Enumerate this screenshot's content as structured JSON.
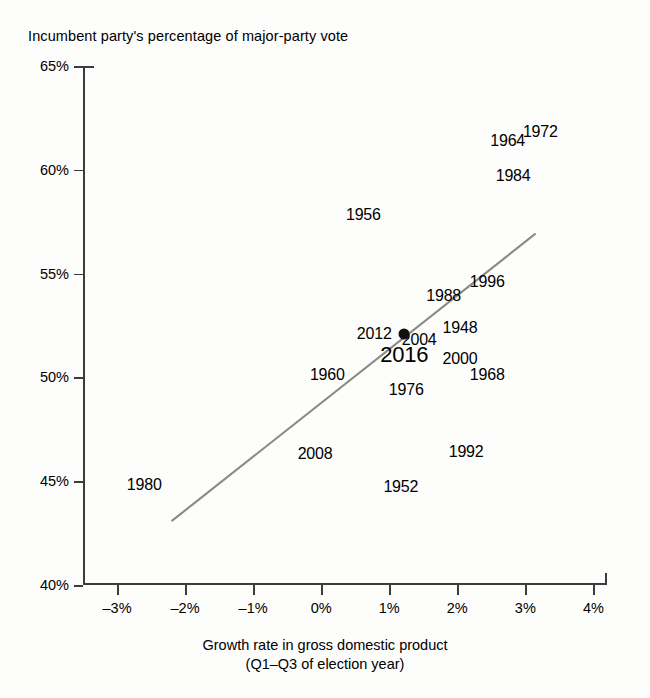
{
  "chart_data": {
    "type": "scatter",
    "title": "",
    "ylabel": "Incumbent party's percentage of major-party vote",
    "xlabel": "Growth rate in gross domestic product",
    "xlabel_line2": "(Q1–Q3 of election year)",
    "xlim": [
      -3.5,
      4.2
    ],
    "ylim": [
      40,
      65
    ],
    "grid": false,
    "legend": null,
    "x_tick_labels": [
      "–3%",
      "–2%",
      "–1%",
      "0%",
      "1%",
      "2%",
      "3%",
      "4%"
    ],
    "x_tick_values": [
      -3,
      -2,
      -1,
      0,
      1,
      2,
      3,
      4
    ],
    "y_tick_labels": [
      "65%",
      "60%",
      "55%",
      "50%",
      "45%",
      "40%"
    ],
    "y_tick_values": [
      65,
      60,
      55,
      50,
      45,
      40
    ],
    "point_label_field": "year",
    "points": [
      {
        "year": "1948",
        "x": 2.04,
        "y": 52.4,
        "marker": "label",
        "highlight": false
      },
      {
        "year": "1952",
        "x": 1.17,
        "y": 44.7,
        "marker": "label",
        "highlight": false
      },
      {
        "year": "1956",
        "x": 0.62,
        "y": 57.8,
        "marker": "label",
        "highlight": false
      },
      {
        "year": "1960",
        "x": 0.09,
        "y": 50.1,
        "marker": "label",
        "highlight": false
      },
      {
        "year": "1964",
        "x": 2.74,
        "y": 61.4,
        "marker": "label",
        "highlight": false
      },
      {
        "year": "1968",
        "x": 2.44,
        "y": 50.1,
        "marker": "label",
        "highlight": false
      },
      {
        "year": "1972",
        "x": 3.22,
        "y": 61.8,
        "marker": "label",
        "highlight": false
      },
      {
        "year": "1976",
        "x": 1.25,
        "y": 49.4,
        "marker": "label",
        "highlight": false
      },
      {
        "year": "1980",
        "x": -2.6,
        "y": 44.8,
        "marker": "label",
        "highlight": false
      },
      {
        "year": "1984",
        "x": 2.82,
        "y": 59.7,
        "marker": "label",
        "highlight": false
      },
      {
        "year": "1988",
        "x": 1.8,
        "y": 53.9,
        "marker": "label",
        "highlight": false
      },
      {
        "year": "1992",
        "x": 2.13,
        "y": 46.4,
        "marker": "label",
        "highlight": false
      },
      {
        "year": "1996",
        "x": 2.44,
        "y": 54.6,
        "marker": "label",
        "highlight": false
      },
      {
        "year": "2000",
        "x": 2.04,
        "y": 50.9,
        "marker": "label",
        "highlight": false
      },
      {
        "year": "2004",
        "x": 1.44,
        "y": 51.8,
        "marker": "label",
        "highlight": false
      },
      {
        "year": "2008",
        "x": -0.09,
        "y": 46.3,
        "marker": "label",
        "highlight": false
      },
      {
        "year": "2012",
        "x": 0.78,
        "y": 52.1,
        "marker": "label",
        "highlight": false
      },
      {
        "year": "2016",
        "x": 1.22,
        "y": 51.1,
        "marker": "label",
        "highlight": true
      }
    ],
    "highlighted_point": {
      "year": "2016",
      "note": "rendered in larger type"
    },
    "marker_dot": {
      "year": "2004",
      "x": 1.22,
      "y": 52.1,
      "style": "filled-black-circle"
    },
    "trendline": {
      "type": "linear",
      "color": "#8a8a8a",
      "x_start": -2.19,
      "y_start": 43.1,
      "x_end": 3.14,
      "y_end": 56.9
    }
  }
}
